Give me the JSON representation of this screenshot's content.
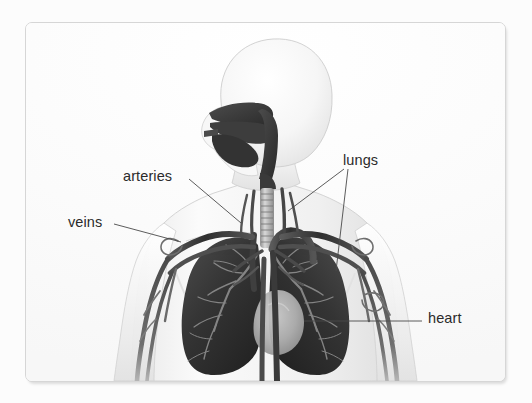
{
  "figure": {
    "kind": "anatomical-diagram",
    "style": "grayscale medical illustration on white card",
    "card": {
      "background": "#fdfdfd",
      "border_color": "#d6d6d6",
      "corner_radius_px": 7
    }
  },
  "palette": {
    "page_background": "#fcfcfc",
    "body_silhouette_light": "#f2f2f2",
    "body_silhouette_mid": "#dcdcdc",
    "body_outline": "#c9c9c9",
    "airway_dark": "#3a3a3a",
    "lung_dark": "#363636",
    "lung_darkest": "#242424",
    "bronchi_light": "#9a9a9a",
    "heart_light": "#b9b9b9",
    "vessel_dark": "#3d3d3d",
    "vessel_mid": "#6a6a6a",
    "label_text": "#2b2b2b",
    "leader_line": "#4a4a4a"
  },
  "labels": [
    {
      "id": "arteries",
      "text": "arteries",
      "text_x": 97,
      "text_y": 146,
      "leader": {
        "from": [
          163,
          156
        ],
        "to": [
          215,
          200
        ]
      },
      "points_to": "subclavian / axillary arteries at right shoulder region"
    },
    {
      "id": "veins",
      "text": "veins",
      "text_x": 42,
      "text_y": 192,
      "leader": {
        "from": [
          88,
          201
        ],
        "to": [
          155,
          219
        ]
      },
      "points_to": "subclavian / axillary veins at right shoulder region"
    },
    {
      "id": "lungs",
      "text": "lungs",
      "text_x": 317,
      "text_y": 130,
      "leader_multi": [
        {
          "from": [
            318,
            146
          ],
          "to": [
            262,
            188
          ]
        },
        {
          "from": [
            322,
            146
          ],
          "to": [
            310,
            248
          ]
        }
      ],
      "points_to": "left and right lungs"
    },
    {
      "id": "heart",
      "text": "heart",
      "text_x": 402,
      "text_y": 288,
      "leader": {
        "from": [
          396,
          298
        ],
        "to": [
          278,
          298
        ]
      },
      "points_to": "heart silhouette between the lungs"
    }
  ],
  "structures": [
    {
      "name": "nasal cavity",
      "shade": "airway_dark"
    },
    {
      "name": "oral cavity",
      "shade": "airway_dark"
    },
    {
      "name": "tongue",
      "shade": "airway_dark"
    },
    {
      "name": "pharynx",
      "shade": "airway_dark"
    },
    {
      "name": "larynx",
      "shade": "airway_dark"
    },
    {
      "name": "trachea",
      "shade": "bronchi_light",
      "detail": "cartilage rings visible as horizontal bands"
    },
    {
      "name": "right lung",
      "shade": "lung_dark",
      "detail": "bronchial tree branching visible in lighter gray"
    },
    {
      "name": "left lung",
      "shade": "lung_dark",
      "detail": "bronchial tree branching visible in lighter gray"
    },
    {
      "name": "heart",
      "shade": "heart_light"
    },
    {
      "name": "aortic arch",
      "shade": "vessel_dark"
    },
    {
      "name": "descending aorta",
      "shade": "vessel_dark"
    },
    {
      "name": "superior vena cava",
      "shade": "vessel_dark"
    },
    {
      "name": "subclavian arteries",
      "shade": "vessel_dark"
    },
    {
      "name": "subclavian veins",
      "shade": "vessel_dark"
    },
    {
      "name": "brachial vessels of both arms",
      "shade": "vessel_mid"
    },
    {
      "name": "carotid arteries",
      "shade": "vessel_dark"
    },
    {
      "name": "jugular veins",
      "shade": "vessel_dark"
    },
    {
      "name": "head and torso silhouette",
      "shade": "body_silhouette_light"
    }
  ]
}
